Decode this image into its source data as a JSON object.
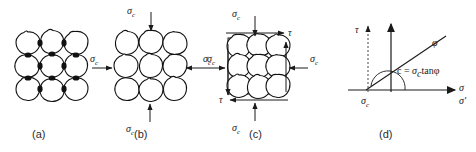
{
  "figure": {
    "stroke_color": "#111111",
    "label_color": "#2b2b2b"
  },
  "panels": [
    {
      "id": "a",
      "label": "(a)",
      "caption": "unstressed grain assembly",
      "grain_rows": 3,
      "grain_cols": 3,
      "loads": []
    },
    {
      "id": "b",
      "label": "(b)",
      "caption": "isotropic confining stress",
      "grain_rows": 3,
      "grain_cols": 3,
      "loads": [
        {
          "name": "sigma-c-top",
          "symbol": "σ",
          "subscript": "c",
          "direction": "down"
        },
        {
          "name": "sigma-c-left",
          "symbol": "σ",
          "subscript": "c",
          "direction": "right"
        },
        {
          "name": "sigma-c-right",
          "symbol": "σ",
          "subscript": "c",
          "direction": "left"
        },
        {
          "name": "sigma-c-bottom",
          "symbol": "σ",
          "subscript": "c",
          "direction": "up"
        }
      ]
    },
    {
      "id": "c",
      "label": "(c)",
      "caption": "confining stress plus shear stress",
      "grain_rows": 3,
      "grain_cols": 3,
      "loads": [
        {
          "name": "sigma-c-top",
          "symbol": "σ",
          "subscript": "c",
          "direction": "down"
        },
        {
          "name": "sigma-c-left",
          "symbol": "σ",
          "subscript": "c",
          "direction": "right"
        },
        {
          "name": "sigma-c-right",
          "symbol": "σ",
          "subscript": "c",
          "direction": "left"
        },
        {
          "name": "sigma-c-bottom",
          "symbol": "σ",
          "subscript": "c",
          "direction": "up"
        },
        {
          "name": "tau-top",
          "symbol": "τ",
          "subscript": "",
          "direction": "right"
        },
        {
          "name": "tau-bottom",
          "symbol": "τ",
          "subscript": "",
          "direction": "left"
        }
      ]
    },
    {
      "id": "d",
      "label": "(d)",
      "caption": "Mohr-Coulomb failure envelope",
      "grain_rows": 0,
      "grain_cols": 0,
      "loads": []
    }
  ],
  "plot": {
    "type": "line",
    "y_axis_label": "τ",
    "x_axis_label": "σ",
    "x_axis_label_secondary": "σ'",
    "dashed_axis_label": "τ",
    "origin_offset_label": "σ",
    "origin_offset_sub": "c",
    "friction_angle_label": "φ",
    "cohesion_equation": "c = σ tanφ",
    "cohesion_equation_parts": {
      "lhs": "c = ",
      "sigma": "σ",
      "sub": "c",
      "rhs": "tanφ"
    }
  },
  "labels": {
    "sigma": "σ",
    "sigma_sub_c": "c",
    "tau": "τ",
    "phi": "φ",
    "sigma_prime": "σ'",
    "cohesion": "c"
  }
}
